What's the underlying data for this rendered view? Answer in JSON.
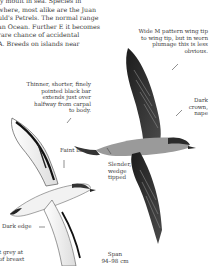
{
  "intro_paragraph": {
    "lines": [
      "ly moult in sea. Species in",
      "where, most alike are the Juan",
      "uld's Petrels. The normal range",
      "an Ocean. Further E it becomes",
      "rare chance of accidental",
      "A. Breeds on islands near"
    ]
  },
  "annotations": {
    "wing_pattern": {
      "lines": [
        "Wide M pattern wing tip",
        "to wing tip, but in worn",
        "plumage this is less",
        "obvious."
      ]
    },
    "underwing_bar": {
      "lines": [
        "Thinner, shorter, finely",
        "pointed black bar",
        "extends just over",
        "halfway from carpal",
        "to body."
      ]
    },
    "faint_bar": {
      "lines": [
        "Faint bar"
      ]
    },
    "crown": {
      "lines": [
        "Dark",
        "crown,",
        "nape"
      ]
    },
    "tail": {
      "lines": [
        "Slender,",
        "wedge",
        "tipped"
      ]
    },
    "dark_edge": {
      "lines": [
        "Dark edge"
      ]
    },
    "breast": {
      "lines": [
        "t grey at",
        "of breast"
      ]
    },
    "span": {
      "lines": [
        "Span",
        "94–98 cm"
      ]
    }
  },
  "illustrations": [
    {
      "name": "petrel-underside",
      "description": "Petrel in flight, underside view"
    },
    {
      "name": "petrel-upperside",
      "description": "Petrel in flight, upperside view with M pattern"
    }
  ]
}
